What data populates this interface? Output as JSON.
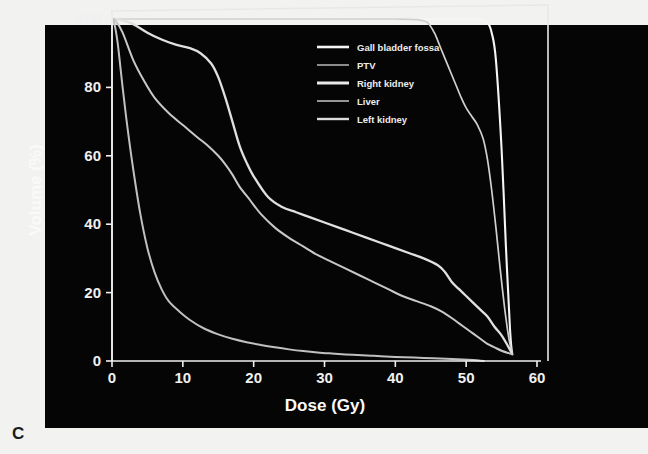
{
  "figure": {
    "panel_letter": "C",
    "background_color": "#050505",
    "page_color": "#f2f2f0",
    "frame_color": "#e8e8e8"
  },
  "chart_data": {
    "type": "line",
    "title": "",
    "subtitle": "",
    "xlabel": "Dose (Gy)",
    "ylabel": "Volume (%)",
    "xlim": [
      0,
      60
    ],
    "ylim": [
      0,
      100
    ],
    "xticks": [
      0,
      10,
      20,
      30,
      40,
      50,
      60
    ],
    "yticks": [
      0,
      20,
      40,
      60,
      80,
      100
    ],
    "xtick_labels": [
      "0",
      "10",
      "20",
      "30",
      "40",
      "50",
      "60"
    ],
    "ytick_labels": [
      "0",
      "20",
      "40",
      "60",
      "80",
      "100"
    ],
    "grid": false,
    "legend_position": "upper-center-right",
    "series": [
      {
        "name": "Gall bladder fossa",
        "color": "#f5f5f5",
        "width": 2.1,
        "x": [
          0,
          1,
          3,
          6,
          10,
          15,
          20,
          25,
          30,
          35,
          40,
          44,
          47,
          49,
          51,
          52,
          53,
          53.6,
          54.2,
          55,
          55.6,
          56.2,
          56.5
        ],
        "y": [
          100,
          100,
          100,
          100,
          100,
          100,
          100,
          100,
          100,
          100,
          100,
          100,
          100,
          100,
          100,
          99.8,
          99,
          96,
          88,
          62,
          34,
          9,
          2
        ]
      },
      {
        "name": "PTV",
        "color": "#d0d0d0",
        "width": 1.7,
        "x": [
          0,
          1,
          3,
          6,
          10,
          15,
          20,
          25,
          30,
          35,
          40,
          43,
          44.5,
          45.5,
          46.5,
          47.5,
          48.5,
          49.3,
          50,
          50.8,
          51.6,
          52.4,
          53,
          53.6,
          54.2,
          54.8,
          55.4,
          56,
          56.5
        ],
        "y": [
          100,
          100,
          100,
          100,
          100,
          100,
          100,
          100,
          100,
          100,
          100,
          99.8,
          99,
          96,
          91,
          86,
          81,
          77,
          74,
          71.5,
          69,
          65,
          59,
          50,
          39,
          27,
          16,
          7,
          2
        ]
      },
      {
        "name": "Right kidney",
        "color": "#e0e0e0",
        "width": 2.3,
        "x": [
          0,
          0.5,
          1.5,
          3,
          5,
          7,
          9,
          11,
          12.5,
          14,
          15,
          16,
          17,
          18,
          19,
          20,
          22,
          24,
          26,
          28,
          30,
          32,
          34,
          36,
          38,
          40,
          42,
          44,
          46,
          47,
          48,
          49,
          50,
          51,
          52,
          53,
          54,
          55,
          56,
          56.5
        ],
        "y": [
          100,
          100,
          99.6,
          98.5,
          96,
          94,
          92.5,
          91.5,
          90,
          87,
          83,
          77,
          70,
          63,
          58,
          54,
          48,
          45,
          43.5,
          42,
          40.5,
          39,
          37.5,
          36,
          34.5,
          33,
          31.5,
          30,
          28,
          26,
          23,
          21,
          19,
          17,
          15,
          13,
          10,
          7.5,
          4,
          2
        ]
      },
      {
        "name": "Liver",
        "color": "#c8c8c8",
        "width": 2.0,
        "x": [
          0,
          0.5,
          1.5,
          3,
          4.5,
          6,
          8,
          10,
          12,
          13.5,
          15,
          16,
          17,
          18,
          19.5,
          21,
          23,
          25,
          27,
          29,
          31,
          33,
          35,
          37,
          39,
          41,
          43,
          45,
          46.5,
          48,
          49,
          50,
          51,
          52,
          53,
          54,
          55,
          56,
          56.5
        ],
        "y": [
          100,
          99.5,
          96,
          88,
          82,
          77,
          72.5,
          69,
          65.5,
          63,
          60,
          57.5,
          54.5,
          51,
          47,
          43,
          39,
          36,
          33.5,
          31,
          29,
          27,
          25,
          23,
          21,
          19,
          17.5,
          16,
          14.5,
          12.5,
          11,
          9.5,
          8,
          6.5,
          5,
          4,
          3,
          2.3,
          2
        ]
      },
      {
        "name": "Left kidney",
        "color": "#c0c0c0",
        "width": 2.0,
        "x": [
          0,
          0.3,
          0.8,
          1.5,
          2.2,
          3,
          4,
          5,
          6,
          7,
          8,
          9.5,
          11,
          13,
          15,
          17,
          19,
          21,
          23,
          25,
          27,
          29,
          31,
          34,
          37,
          40,
          44,
          48,
          51,
          52,
          52.5
        ],
        "y": [
          100,
          99,
          93,
          80,
          68,
          56,
          43,
          33,
          26,
          21,
          17.5,
          14.5,
          12,
          9.5,
          7.8,
          6.5,
          5.5,
          4.7,
          4.0,
          3.4,
          2.9,
          2.5,
          2.2,
          1.8,
          1.5,
          1.2,
          0.9,
          0.6,
          0.3,
          0.1,
          0
        ]
      }
    ],
    "legend_entries": [
      {
        "label": "Gall bladder fossa",
        "color": "#f5f5f5",
        "width": 2.6
      },
      {
        "label": "PTV",
        "color": "#b8b8b8",
        "width": 1.5
      },
      {
        "label": "Right kidney",
        "color": "#eaeaea",
        "width": 3.0
      },
      {
        "label": "Liver",
        "color": "#a8a8a8",
        "width": 1.8
      },
      {
        "label": "Left kidney",
        "color": "#dcdcdc",
        "width": 2.4
      }
    ]
  },
  "geometry": {
    "x0_px": 157,
    "x1_px": 582,
    "y0_px": 386,
    "y1_px": 44
  }
}
